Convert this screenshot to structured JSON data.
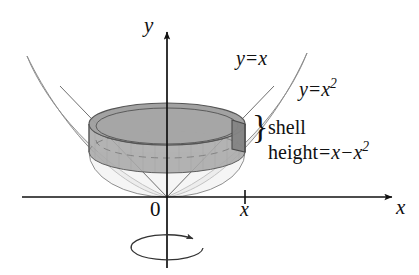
{
  "figure": {
    "background_color": "#ffffff",
    "ink_color": "#111111"
  },
  "axes": {
    "y_axis_label": "y",
    "x_axis_label": "x",
    "origin_label": "0",
    "x_tick_label": "x",
    "x_axis_y_px": 197,
    "y_axis_x_px": 167,
    "x_tick_x_px": 245
  },
  "curves": {
    "line_label_lhs": "y",
    "line_label_eq": "=",
    "line_label_rhs": "x",
    "parabola_label_lhs": "y",
    "parabola_label_eq": "=",
    "parabola_label_rhs": "x",
    "parabola_label_exponent": "2"
  },
  "annotations": {
    "brace_glyph": "}",
    "shell_word": "shell",
    "height_word": "height",
    "height_eq": "=",
    "height_term1": "x",
    "height_minus": "−",
    "height_term2": "x",
    "height_exponent": "2"
  },
  "shell": {
    "description": "cylindrical shell drawn as a grey disc with top annulus rim and darker right face",
    "fill_body": "#a9a9a9",
    "fill_top": "#9d9d9d",
    "fill_right_face": "#8a8a8a",
    "outline": "#5c5c5c",
    "center_x_px": 167,
    "right_edge_x_px": 245,
    "left_edge_x_px": 89,
    "top_rim_y_px": 118,
    "bottom_rim_y_px": 158
  },
  "region": {
    "description": "two thin crescent wings between the line y = x and the parabola y = x squared, shown as the surface of revolution",
    "fill": "#e9e9e9",
    "outline": "#8f8f8f",
    "left_tip_px": [
      27,
      56
    ],
    "right_tip_px": [
      307,
      53
    ]
  },
  "rotation_indicator": {
    "description": "ellipse with arrowhead below the origin showing revolution about the y-axis",
    "center_px": [
      167,
      248
    ],
    "width_px": 72,
    "height_px": 25,
    "arrow_direction": "left",
    "stroke": "#333333"
  }
}
